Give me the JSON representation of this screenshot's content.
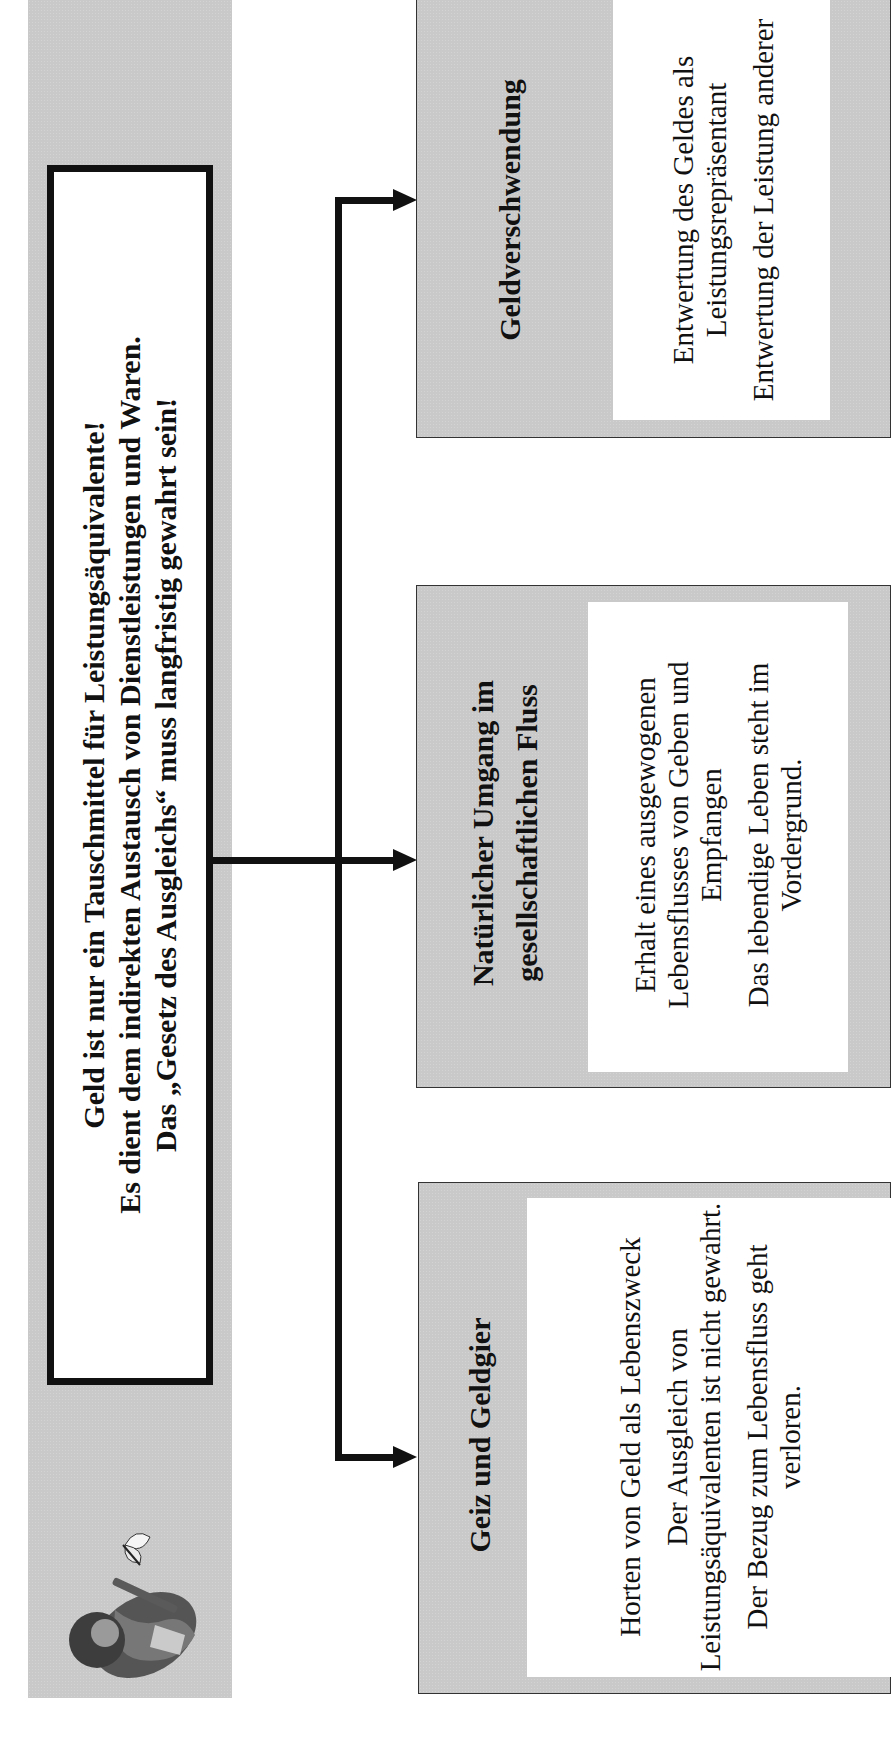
{
  "header": {
    "lines": [
      "Geld ist nur ein Tauschmittel für Leistungsäquivalente!",
      "Es dient dem indirekten Austausch von Dienstleistungen und Waren.",
      "Das „Gesetz des Ausgleichs“ muss langfristig gewahrt sein!"
    ],
    "illustration": "man-with-butterfly-illustration"
  },
  "colors": {
    "panel_gray": "#c9c9c9",
    "line_black": "#111111",
    "box_white": "#ffffff"
  },
  "boxes": [
    {
      "title": "Geiz und Geldgier",
      "items": [
        "Horten von Geld als Lebenszweck",
        "Der Ausgleich von Leistungsäquivalenten ist nicht gewahrt.",
        "Der Bezug zum Lebensfluss geht verloren."
      ]
    },
    {
      "title": "Natürlicher Umgang im gesellschaftlichen Fluss",
      "items": [
        "Erhalt eines ausgewogenen Lebensflusses von Geben und Empfangen",
        "Das lebendige Leben steht im Vordergrund."
      ]
    },
    {
      "title": "Geldverschwendung",
      "items": [
        "Entwertung des Geldes als Leistungsrepräsentant",
        "Entwertung der Leistung anderer"
      ]
    }
  ]
}
